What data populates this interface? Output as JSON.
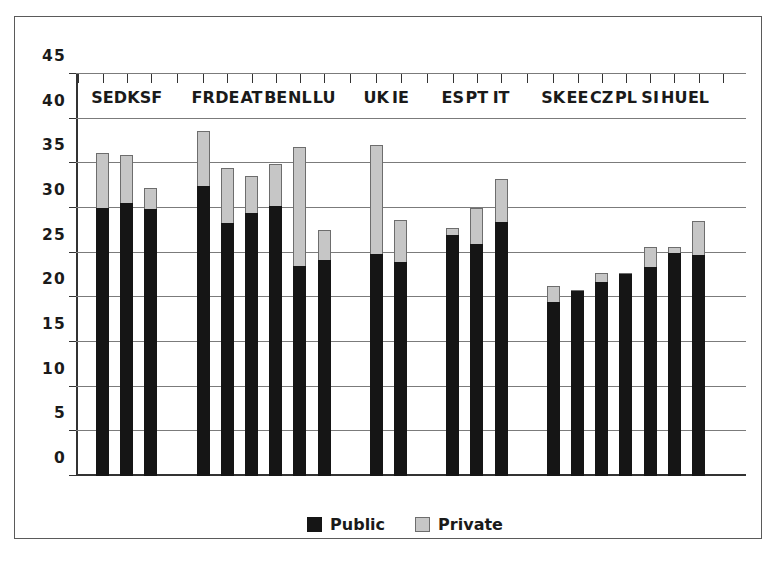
{
  "chart_data": {
    "type": "bar",
    "subtype": "stacked-bar",
    "title": "",
    "xlabel": "",
    "ylabel": "",
    "ylim": [
      0,
      45
    ],
    "ytick_step": 5,
    "yticks": [
      0,
      5,
      10,
      15,
      20,
      25,
      30,
      35,
      40,
      45
    ],
    "ytick_labels": [
      "0",
      "5",
      "10",
      "15",
      "20",
      "25",
      "30",
      "35",
      "40",
      "45"
    ],
    "grid": true,
    "grid_axis": "y",
    "legend_position": "bottom-center",
    "categories": [
      "SE",
      "DK",
      "SF",
      "FR",
      "DE",
      "AT",
      "BE",
      "NL",
      "LU",
      "UK",
      "IE",
      "ES",
      "PT",
      "IT",
      "SK",
      "EE",
      "CZ",
      "PL",
      "SI",
      "HU",
      "EL"
    ],
    "groups": [
      {
        "name": "group-1",
        "members": [
          "SE",
          "DK",
          "SF"
        ]
      },
      {
        "name": "group-2",
        "members": [
          "FR",
          "DE",
          "AT",
          "BE",
          "NL",
          "LU"
        ]
      },
      {
        "name": "group-3",
        "members": [
          "UK",
          "IE"
        ]
      },
      {
        "name": "group-4",
        "members": [
          "ES",
          "PT",
          "IT"
        ]
      },
      {
        "name": "group-5",
        "members": [
          "SK",
          "EE",
          "CZ",
          "PL",
          "SI",
          "HU",
          "EL"
        ]
      }
    ],
    "series": [
      {
        "name": "Public",
        "color": "#151515",
        "values": [
          30.0,
          30.6,
          29.9,
          32.5,
          28.3,
          29.4,
          30.2,
          23.5,
          24.2,
          24.9,
          24.0,
          27.0,
          26.0,
          28.4,
          19.5,
          20.7,
          21.7,
          22.6,
          23.4,
          25.0,
          24.7
        ]
      },
      {
        "name": "Private",
        "color": "#c6c6c6",
        "values": [
          6.2,
          5.3,
          2.3,
          6.1,
          6.2,
          4.2,
          4.7,
          13.3,
          3.3,
          12.2,
          4.7,
          0.8,
          4.0,
          4.8,
          1.8,
          0.1,
          1.0,
          0.1,
          2.2,
          0.6,
          3.8
        ]
      }
    ],
    "totals": [
      36.2,
      35.9,
      32.2,
      38.6,
      34.5,
      33.6,
      34.9,
      36.8,
      27.5,
      37.1,
      28.7,
      27.8,
      30.0,
      33.2,
      21.3,
      20.8,
      22.7,
      22.7,
      25.6,
      25.6,
      28.5
    ]
  },
  "legend": {
    "items": [
      {
        "label": "Public",
        "swatch": "public-swatch",
        "color": "#151515"
      },
      {
        "label": "Private",
        "swatch": "private-swatch",
        "color": "#c6c6c6"
      }
    ]
  },
  "colors": {
    "public": "#151515",
    "private": "#c6c6c6",
    "gridline": "#7b7b7b",
    "axis": "#333333",
    "frame": "#5a5a5a",
    "background": "#ffffff"
  }
}
